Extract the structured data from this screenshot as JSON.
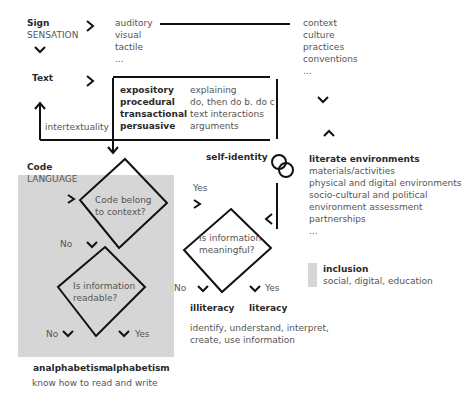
{
  "sign": {
    "title": "Sign",
    "subtitle": "SENSATION",
    "modes": [
      "auditory",
      "visual",
      "tactile",
      "..."
    ]
  },
  "context": {
    "items": [
      "context",
      "culture",
      "practices",
      "conventions",
      "..."
    ]
  },
  "text": {
    "title": "Text",
    "types": [
      "expository",
      "procedural",
      "transactional",
      "persuasive"
    ],
    "descriptions": [
      "explaining",
      "do, then do b. do c",
      "text interactions",
      "arguments"
    ],
    "intertextuality_label": "intertextuality"
  },
  "code": {
    "title": "Code",
    "subtitle": "LANGUAGE",
    "decision1": {
      "line1": "Code belong",
      "line2": "to context?",
      "no_label": "No",
      "yes_label": "Yes"
    },
    "decision2": {
      "line1": "Is information",
      "line2": "readable?",
      "no_label": "No",
      "yes_label": "Yes"
    },
    "outcomes": {
      "no": "analphabetism",
      "yes": "alphabetism"
    },
    "outcome_desc": "know how to read and write"
  },
  "self_identity": {
    "label": "self-identity"
  },
  "meaning": {
    "decision": {
      "line1": "Is information",
      "line2": "meaningful?",
      "no_label": "No",
      "yes_label": "Yes"
    },
    "outcomes": {
      "no": "illiteracy",
      "yes": "literacy"
    },
    "outcome_desc": [
      "identify, understand, interpret,",
      "create, use information"
    ]
  },
  "environments": {
    "title": "literate environments",
    "items": [
      "materials/activities",
      "physical and digital environments",
      "socio-cultural and political",
      "environment assessment",
      "partnerships",
      "..."
    ]
  },
  "legend": {
    "title": "inclusion",
    "desc": "social, digital, education",
    "swatch_color": "#d6d6d6"
  }
}
